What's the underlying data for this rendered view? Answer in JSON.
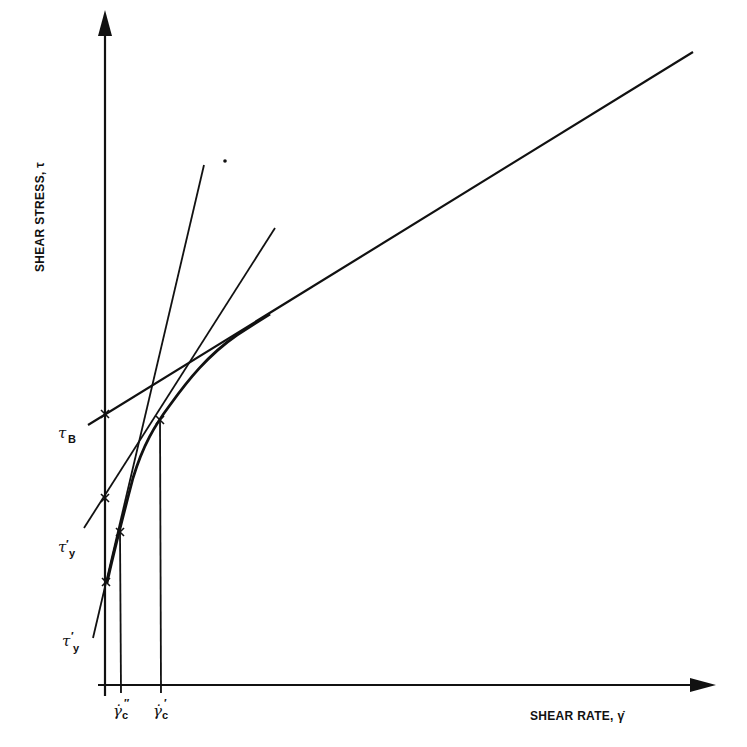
{
  "figure": {
    "type": "rheogram",
    "colors": {
      "ink": "#111111",
      "background": "#ffffff"
    }
  },
  "axes": {
    "x_label": "SHEAR RATE, γ̇",
    "y_label": "SHEAR STRESS, τ"
  },
  "labels": {
    "tau_B": {
      "main": "τ",
      "sub": "B"
    },
    "tau_y": {
      "main": "τ",
      "prime": "′",
      "sub": "y"
    },
    "tau_y_prime": {
      "main": "τ",
      "prime": "′",
      "sub": "y"
    },
    "gamma_c_double": {
      "main": "γ̇",
      "prime": "″",
      "sub": "c"
    },
    "gamma_c_single": {
      "main": "γ̇",
      "prime": "′",
      "sub": "c"
    }
  },
  "lines": [
    {
      "name": "bingham-line",
      "description": "Linear asymptote of flow curve; intercept τB"
    },
    {
      "name": "tangent-line-gamma-c-single",
      "description": "Tangent at γ̇′c; intercept τy"
    },
    {
      "name": "tangent-line-gamma-c-double",
      "description": "Tangent at γ̇″c; intercept τ′y"
    },
    {
      "name": "flow-curve",
      "description": "Nonlinear shear stress curve approaching Bingham line"
    }
  ]
}
